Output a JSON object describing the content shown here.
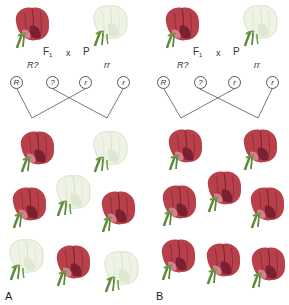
{
  "figure": {
    "panels": [
      {
        "id": "A",
        "letter": "A",
        "parents": {
          "left": {
            "phenotype": "red",
            "generation_label": "F",
            "generation_sub": "1",
            "genotype": "R?"
          },
          "cross_symbol": "x",
          "right": {
            "phenotype": "white",
            "generation_label": "P",
            "genotype": "rr"
          }
        },
        "gametes": [
          "R",
          "?",
          "r",
          "r"
        ],
        "offspring": [
          "red",
          "white",
          "red",
          "white",
          "red",
          "white",
          "red",
          "white"
        ]
      },
      {
        "id": "B",
        "letter": "B",
        "parents": {
          "left": {
            "phenotype": "red",
            "generation_label": "F",
            "generation_sub": "1",
            "genotype": "R?"
          },
          "cross_symbol": "x",
          "right": {
            "phenotype": "white",
            "generation_label": "P",
            "genotype": "rr"
          }
        },
        "gametes": [
          "R",
          "?",
          "r",
          "r"
        ],
        "offspring": [
          "red",
          "red",
          "red",
          "red",
          "red",
          "red",
          "red",
          "red"
        ]
      }
    ],
    "colors": {
      "red_petal": "#b8404a",
      "red_dark": "#7a2030",
      "white_petal": "#eef3e4",
      "white_shade": "#d3dcc6",
      "stem": "#5c8a3a",
      "line": "#555555"
    }
  }
}
